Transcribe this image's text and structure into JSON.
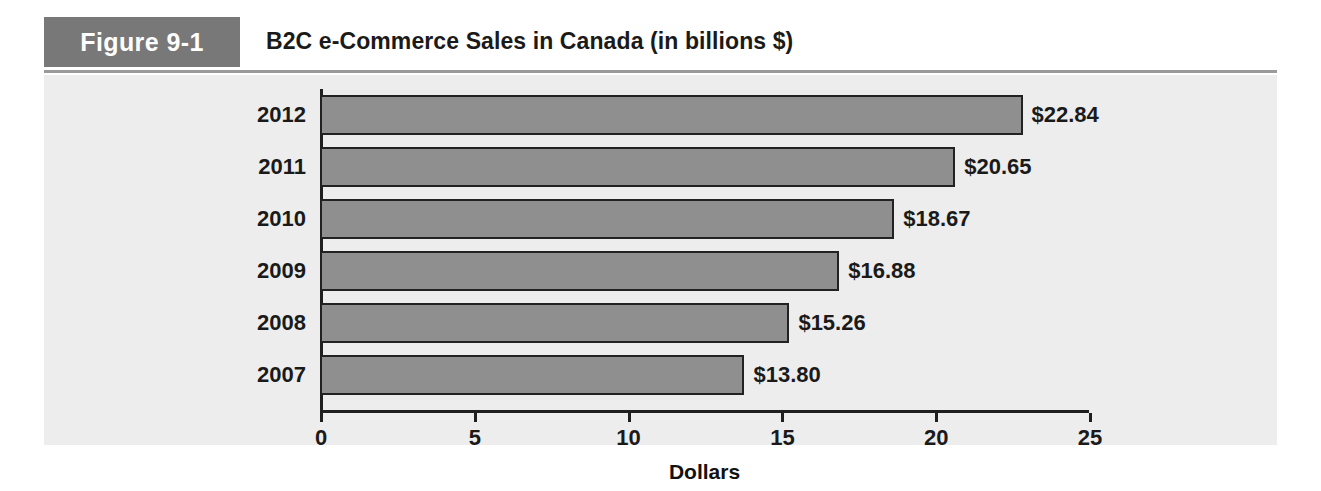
{
  "figure": {
    "tag": "Figure 9-1",
    "title": "B2C e-Commerce Sales in Canada (in billions $)"
  },
  "chart_data": {
    "type": "bar",
    "orientation": "horizontal",
    "title": "B2C e-Commerce Sales in Canada (in billions $)",
    "categories": [
      "2012",
      "2011",
      "2010",
      "2009",
      "2008",
      "2007"
    ],
    "values": [
      22.84,
      20.65,
      18.67,
      16.88,
      15.26,
      13.8
    ],
    "value_labels": [
      "$22.84",
      "$20.65",
      "$18.67",
      "$16.88",
      "$15.26",
      "$13.80"
    ],
    "xlabel": "Dollars",
    "ylabel": "",
    "xlim": [
      0,
      25
    ],
    "xticks": [
      0,
      5,
      10,
      15,
      20,
      25
    ],
    "xtick_labels": [
      "0",
      "5",
      "10",
      "15",
      "20",
      "25"
    ],
    "grid": false,
    "legend": false,
    "series_color": "#8f8f8f",
    "bar_border_color": "#222222",
    "axis_color": "#1f1f1f",
    "panel_background": "#ededed",
    "tag_background": "#787878"
  }
}
